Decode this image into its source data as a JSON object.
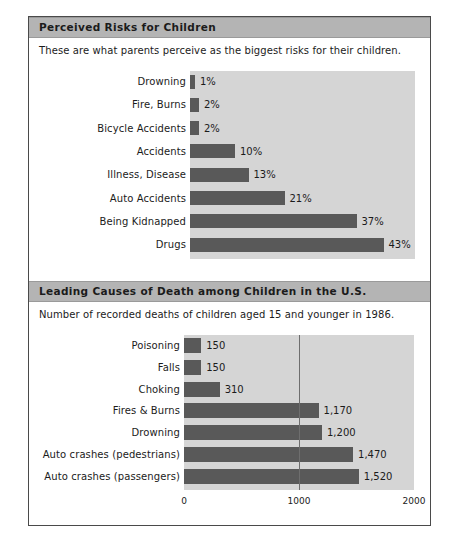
{
  "figure": {
    "panels": [
      {
        "id": "perceived-risks",
        "title": "Perceived Risks for Children",
        "subtitle": "These are what parents perceive as the biggest risks for their children."
      },
      {
        "id": "leading-causes",
        "title": "Leading Causes of Death among Children in the U.S.",
        "subtitle": "Number of recorded deaths of children aged 15 and younger in 1986."
      }
    ]
  },
  "colors": {
    "bar": "#595959",
    "plot_background": "#d5d5d5",
    "header_background": "#b4b4b4",
    "text": "#1b1b1b",
    "border": "#4a4a4a",
    "gridline": "#6e6e6e"
  },
  "chart_data": [
    {
      "type": "bar",
      "orientation": "horizontal",
      "title": "Perceived Risks for Children",
      "subtitle": "These are what parents perceive as the biggest risks for their children.",
      "xlabel": "",
      "ylabel": "",
      "xlim": [
        0,
        50
      ],
      "grid": false,
      "legend": "none",
      "categories": [
        "Drowning",
        "Fire, Burns",
        "Bicycle Accidents",
        "Accidents",
        "Illness, Disease",
        "Auto Accidents",
        "Being Kidnapped",
        "Drugs"
      ],
      "values": [
        1,
        2,
        2,
        10,
        13,
        21,
        37,
        43
      ],
      "data_labels": [
        "1%",
        "2%",
        "2%",
        "10%",
        "13%",
        "21%",
        "37%",
        "43%"
      ],
      "tick_labels": []
    },
    {
      "type": "bar",
      "orientation": "horizontal",
      "title": "Leading Causes of Death among Children in the U.S.",
      "subtitle": "Number of recorded deaths of children aged 15 and younger in 1986.",
      "xlabel": "",
      "ylabel": "",
      "xlim": [
        0,
        2000
      ],
      "grid": true,
      "legend": "none",
      "categories": [
        "Poisoning",
        "Falls",
        "Choking",
        "Fires & Burns",
        "Drowning",
        "Auto crashes (pedestrians)",
        "Auto crashes (passengers)"
      ],
      "values": [
        150,
        150,
        310,
        1170,
        1200,
        1470,
        1520
      ],
      "data_labels": [
        "150",
        "150",
        "310",
        "1,170",
        "1,200",
        "1,470",
        "1,520"
      ],
      "tick_labels": [
        "0",
        "1000",
        "2000"
      ],
      "tick_values": [
        0,
        1000,
        2000
      ]
    }
  ]
}
